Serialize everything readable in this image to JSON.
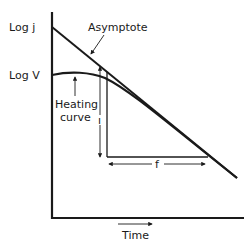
{
  "diagram": {
    "title": "",
    "y_axis_labels": {
      "log_j": "Log j",
      "log_v": "Log V"
    },
    "x_axis_label": "Time",
    "annotations": {
      "asymptote": "Asymptote",
      "heating_curve_line1": "Heating",
      "heating_curve_line2": "curve",
      "f_label": "f"
    },
    "colors": {
      "ink": "#1a1a1a",
      "background": "#ffffff"
    }
  }
}
